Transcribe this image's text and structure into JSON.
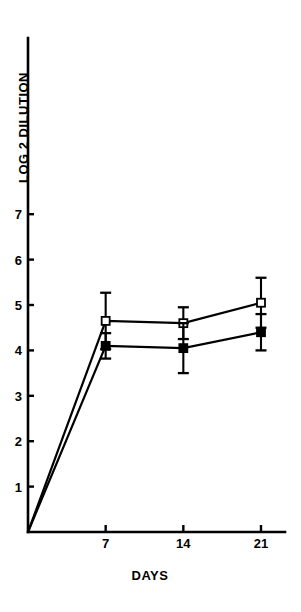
{
  "chart_data": {
    "type": "line",
    "title": "",
    "subtitle": "",
    "xlabel": "DAYS",
    "ylabel": "LOG 2 DILUTION",
    "x": [
      0,
      7,
      14,
      21
    ],
    "xticks": [
      7,
      14,
      21
    ],
    "xtick_labels": [
      "7",
      "14",
      "21"
    ],
    "yticks": [
      1,
      2,
      3,
      4,
      5,
      6,
      7
    ],
    "ytick_labels": [
      "1",
      "2",
      "3",
      "4",
      "5",
      "6",
      "7"
    ],
    "xlim": [
      0,
      23
    ],
    "ylim": [
      0,
      8.7
    ],
    "grid": false,
    "legend": "none",
    "marker_style": {
      "open_square": "hollow square, black outline, white fill",
      "filled_square": "solid black square"
    },
    "series": [
      {
        "name": "open-square-series",
        "marker": "open_square",
        "color": "#000000",
        "x": [
          0,
          7,
          14,
          21
        ],
        "values": [
          0,
          4.65,
          4.6,
          5.05
        ],
        "errors": [
          0,
          0.62,
          0.35,
          0.55
        ]
      },
      {
        "name": "filled-square-series",
        "marker": "filled_square",
        "color": "#000000",
        "x": [
          0,
          7,
          14,
          21
        ],
        "values": [
          0,
          4.1,
          4.05,
          4.4
        ],
        "errors": [
          0,
          0.28,
          0.55,
          0.4
        ]
      }
    ]
  },
  "figure": {
    "background_color": "#ffffff",
    "axis_color": "#000000",
    "ylabel_text": "LOG 2 DILUTION",
    "xlabel_text": "DAYS"
  }
}
